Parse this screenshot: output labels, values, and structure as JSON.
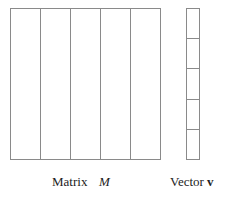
{
  "matrix": {
    "label": "Matrix",
    "symbol": "M",
    "columns": 5,
    "x": 10,
    "y": 8,
    "width": 150,
    "height": 151
  },
  "vector": {
    "label": "Vector",
    "symbol": "v",
    "cells": 5,
    "x": 186,
    "y": 8,
    "width": 13,
    "height": 151
  },
  "colors": {
    "stroke": "#8a8a8a",
    "text": "#222222",
    "background": "#ffffff"
  }
}
